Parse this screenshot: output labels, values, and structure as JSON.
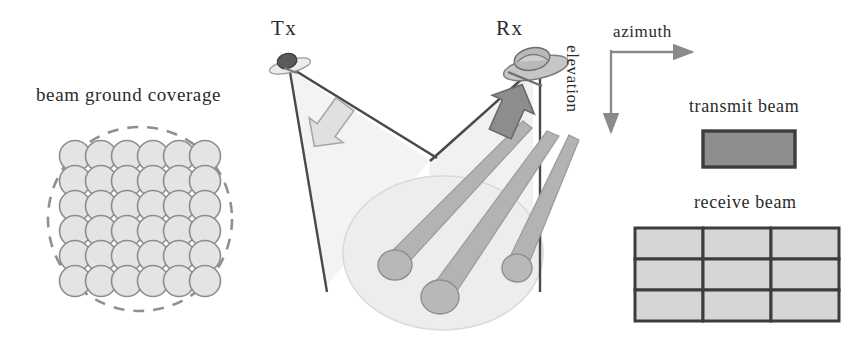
{
  "figure": {
    "title_visible": false,
    "background_color": "#ffffff"
  },
  "panels": {
    "ground_coverage": {
      "label": "beam ground coverage",
      "grid_rows": 6,
      "grid_cols": 6,
      "cell_shape": "circle",
      "circle_fill": "#e3e3e3",
      "circle_stroke": "#8c8c8c",
      "boundary_shape": "dashed-circle",
      "boundary_stroke": "#8f8f8f"
    },
    "geometry": {
      "tx_label": "Tx",
      "rx_label": "Rx",
      "tx_icon": "transmit-antenna-icon",
      "rx_icon": "receive-dish-icon",
      "tx_arrow_icon": "tx-scan-arrow-icon",
      "rx_arrow_icon": "rx-scan-arrow-icon",
      "beam_count": 3,
      "footprint_shape": "ellipse",
      "footprint_fill": "#ededed",
      "beam_fill": "#b0b0b0",
      "cone_fill": "#f2f2f2",
      "line_color": "#4a4a4a"
    },
    "axes": {
      "azimuth_label": "azimuth",
      "elevation_label": "elevation",
      "azimuth_direction": "right",
      "elevation_direction": "down",
      "axis_color": "#8a8a8a"
    },
    "transmit_beam": {
      "label": "transmit beam",
      "rows": 1,
      "cols": 1,
      "fill": "#8e8e8e",
      "stroke": "#3c3c3c"
    },
    "receive_beam": {
      "label": "receive beam",
      "rows": 3,
      "cols": 3,
      "fill": "#d6d6d6",
      "stroke": "#3c3c3c"
    }
  }
}
